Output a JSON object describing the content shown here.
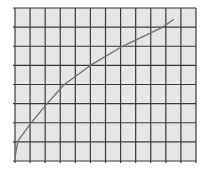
{
  "chart_data": {
    "type": "line",
    "title": "",
    "xlabel": "",
    "ylabel": "",
    "grid": true,
    "legend": null,
    "xlim": [
      0,
      12
    ],
    "ylim": [
      0,
      8
    ],
    "grid_columns": 12,
    "grid_rows": 8,
    "series": [
      {
        "name": "curve",
        "x": [
          0,
          0.2,
          1.07,
          2.13,
          3.27,
          5.0,
          7.13,
          9.8,
          10.5
        ],
        "y": [
          0.2,
          1.05,
          2.0,
          3.0,
          4.0,
          5.0,
          6.0,
          7.0,
          7.4
        ]
      }
    ],
    "colors": {
      "background": "#e6e6e6",
      "grid": "#3a3a3a",
      "curve": "#707070"
    }
  },
  "plot_area": {
    "left": 15,
    "top": 8,
    "right": 196,
    "bottom": 161
  }
}
